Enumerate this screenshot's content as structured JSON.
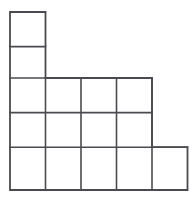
{
  "figure": {
    "name": "staircase-polyomino-grid",
    "background_color": "#ffffff",
    "line_color": "#4a4a50",
    "line_width": 1.6,
    "cell_width": 35.5,
    "cell_height": 34.6,
    "origin_x": 10,
    "origin_y": 12,
    "columns": 5,
    "rows": 5,
    "total_squares": 13,
    "x_lines": [
      10,
      45.5,
      81,
      116.5,
      152,
      187.5
    ],
    "y_lines": [
      12,
      46.6,
      78,
      112.6,
      147.2,
      190
    ],
    "row_cells": [
      {
        "row": 1,
        "start_col": 1,
        "end_col": 1,
        "count": 1
      },
      {
        "row": 2,
        "start_col": 1,
        "end_col": 1,
        "count": 1
      },
      {
        "row": 3,
        "start_col": 1,
        "end_col": 4,
        "count": 4
      },
      {
        "row": 4,
        "start_col": 1,
        "end_col": 4,
        "count": 4
      },
      {
        "row": 5,
        "start_col": 1,
        "end_col": 5,
        "count": 5
      }
    ],
    "cells": [
      {
        "id": "r1c1",
        "x": 10,
        "y": 12,
        "w": 35.5,
        "h": 34.6
      },
      {
        "id": "r2c1",
        "x": 10,
        "y": 46.6,
        "w": 35.5,
        "h": 31.4
      },
      {
        "id": "r3c1",
        "x": 10,
        "y": 78,
        "w": 35.5,
        "h": 34.6
      },
      {
        "id": "r3c2",
        "x": 45.5,
        "y": 78,
        "w": 35.5,
        "h": 34.6
      },
      {
        "id": "r3c3",
        "x": 81,
        "y": 78,
        "w": 35.5,
        "h": 34.6
      },
      {
        "id": "r3c4",
        "x": 116.5,
        "y": 78,
        "w": 35.5,
        "h": 34.6
      },
      {
        "id": "r4c1",
        "x": 10,
        "y": 112.6,
        "w": 35.5,
        "h": 34.6
      },
      {
        "id": "r4c2",
        "x": 45.5,
        "y": 112.6,
        "w": 35.5,
        "h": 34.6
      },
      {
        "id": "r4c3",
        "x": 81,
        "y": 112.6,
        "w": 35.5,
        "h": 34.6
      },
      {
        "id": "r4c4",
        "x": 116.5,
        "y": 112.6,
        "w": 35.5,
        "h": 34.6
      },
      {
        "id": "r5c1",
        "x": 10,
        "y": 147.2,
        "w": 35.5,
        "h": 42.8
      },
      {
        "id": "r5c2",
        "x": 45.5,
        "y": 147.2,
        "w": 35.5,
        "h": 42.8
      },
      {
        "id": "r5c3",
        "x": 81,
        "y": 147.2,
        "w": 35.5,
        "h": 42.8
      },
      {
        "id": "r5c4",
        "x": 116.5,
        "y": 147.2,
        "w": 35.5,
        "h": 42.8
      },
      {
        "id": "r5c5",
        "x": 152,
        "y": 147.2,
        "w": 35.5,
        "h": 42.8
      }
    ],
    "outline_path": "M 10 12 L 45.5 12 L 45.5 78 L 152 78 L 152 147.2 L 187.5 147.2 L 187.5 190 L 10 190 Z",
    "interior_segments": [
      {
        "type": "horizontal",
        "x1": 10,
        "y1": 46.6,
        "x2": 45.5,
        "y2": 46.6
      },
      {
        "type": "horizontal",
        "x1": 10,
        "y1": 78,
        "x2": 45.5,
        "y2": 78
      },
      {
        "type": "horizontal",
        "x1": 10,
        "y1": 112.6,
        "x2": 152,
        "y2": 112.6
      },
      {
        "type": "horizontal",
        "x1": 10,
        "y1": 147.2,
        "x2": 187.5,
        "y2": 147.2
      },
      {
        "type": "vertical",
        "x1": 45.5,
        "y1": 78,
        "x2": 45.5,
        "y2": 190
      },
      {
        "type": "vertical",
        "x1": 81,
        "y1": 78,
        "x2": 81,
        "y2": 190
      },
      {
        "type": "vertical",
        "x1": 116.5,
        "y1": 78,
        "x2": 116.5,
        "y2": 190
      },
      {
        "type": "vertical",
        "x1": 152,
        "y1": 78,
        "x2": 152,
        "y2": 190
      }
    ]
  }
}
